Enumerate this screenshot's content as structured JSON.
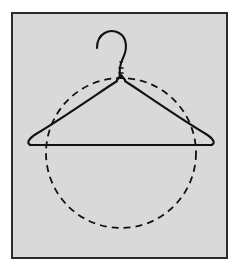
{
  "figure": {
    "kind": "line-drawing",
    "width": 243,
    "height": 273
  },
  "canvas": {
    "outer_background": "#ffffff",
    "panel_background": "#d7d7d7",
    "panel_border_color": "#2b2b2b",
    "panel_border_width": 2,
    "panel": {
      "x": 11,
      "y": 12,
      "width": 217,
      "height": 247
    }
  },
  "shapes": {
    "circle": {
      "name": "dashed-circle",
      "style": "dashed",
      "stroke": "#111111",
      "stroke_width": 1.8,
      "dash_length": 7,
      "gap_length": 5,
      "center_x": 121,
      "center_y": 153,
      "radius": 75
    },
    "hanger": {
      "name": "wire-hanger",
      "style": "solid",
      "stroke": "#111111",
      "stroke_width": 2.1,
      "apex_x": 121,
      "apex_y": 80,
      "bar_y": 145,
      "left_tip_x": 27,
      "right_tip_x": 214,
      "hook_top_y": 33,
      "hook_curl_opening": "left"
    }
  },
  "labels": {
    "figure_caption": "",
    "axis_labels": [],
    "annotations": []
  }
}
